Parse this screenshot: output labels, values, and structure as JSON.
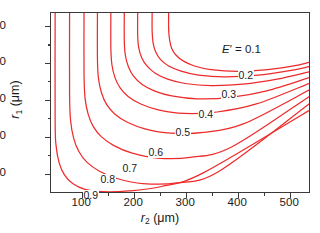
{
  "figure": {
    "background": "#ffffff",
    "frame_color": "#3a3a3a",
    "contour_color": "#ee2b2b"
  },
  "axes": {
    "x_title_var": "r",
    "x_title_sub": "2",
    "x_title_unit": " (μm)",
    "y_title_var": "r",
    "y_title_sub": "1",
    "y_title_unit": " (μm)",
    "x_ticks": [
      "100",
      "200",
      "300",
      "400",
      "500"
    ],
    "y_ticks": [
      "500",
      "400",
      "300",
      "200",
      "100"
    ]
  },
  "series_label": {
    "prefix_var": "E",
    "prefix_prime": "′",
    "prefix_eq": " = ",
    "first_value": "0.1"
  },
  "contour_labels": [
    "0.1",
    "0.2",
    "0.3",
    "0.4",
    "0.5",
    "0.6",
    "0.7",
    "0.8",
    "0.9"
  ],
  "chart_data": {
    "type": "line",
    "title": "",
    "subtitle": "",
    "xlabel": "r2 (μm)",
    "ylabel": "r1 (μm)",
    "xlim": [
      40,
      540
    ],
    "ylim": [
      55,
      545
    ],
    "grid": false,
    "legend": "inline contour labels",
    "annotations": [
      "E' = 0.1"
    ],
    "x_tick_values": [
      100,
      200,
      300,
      400,
      500
    ],
    "y_tick_values": [
      100,
      200,
      300,
      400,
      500
    ],
    "x_minor_tick_values": [
      150,
      250,
      350,
      450
    ],
    "y_minor_tick_values": [
      150,
      250,
      350,
      450
    ],
    "series": [
      {
        "name": "0.1",
        "label": "0.1",
        "label_at": [
          305,
          470
        ],
        "points": [
          [
            268,
            545
          ],
          [
            268,
            500
          ],
          [
            270,
            470
          ],
          [
            274,
            448
          ],
          [
            282,
            430
          ],
          [
            296,
            414
          ],
          [
            318,
            400
          ],
          [
            350,
            390
          ],
          [
            400,
            385
          ],
          [
            460,
            390
          ],
          [
            510,
            400
          ],
          [
            540,
            410
          ]
        ]
      },
      {
        "name": "0.2",
        "label": "0.2",
        "label_at": [
          300,
          415
        ],
        "points": [
          [
            236,
            545
          ],
          [
            236,
            495
          ],
          [
            238,
            462
          ],
          [
            243,
            438
          ],
          [
            252,
            418
          ],
          [
            268,
            400
          ],
          [
            292,
            386
          ],
          [
            326,
            375
          ],
          [
            376,
            370
          ],
          [
            436,
            374
          ],
          [
            496,
            386
          ],
          [
            540,
            398
          ]
        ]
      },
      {
        "name": "0.3",
        "label": "0.3",
        "label_at": [
          280,
          368
        ],
        "points": [
          [
            208,
            545
          ],
          [
            208,
            485
          ],
          [
            210,
            450
          ],
          [
            216,
            422
          ],
          [
            226,
            400
          ],
          [
            242,
            380
          ],
          [
            266,
            364
          ],
          [
            300,
            352
          ],
          [
            350,
            346
          ],
          [
            412,
            350
          ],
          [
            478,
            364
          ],
          [
            540,
            384
          ]
        ]
      },
      {
        "name": "0.4",
        "label": "0.4",
        "label_at": [
          252,
          312
        ],
        "points": [
          [
            182,
            545
          ],
          [
            182,
            470
          ],
          [
            184,
            430
          ],
          [
            190,
            398
          ],
          [
            200,
            372
          ],
          [
            216,
            350
          ],
          [
            240,
            332
          ],
          [
            274,
            318
          ],
          [
            324,
            310
          ],
          [
            388,
            314
          ],
          [
            458,
            332
          ],
          [
            540,
            368
          ]
        ]
      },
      {
        "name": "0.5",
        "label": "0.5",
        "label_at": [
          222,
          264
        ],
        "points": [
          [
            156,
            545
          ],
          [
            156,
            450
          ],
          [
            158,
            404
          ],
          [
            164,
            368
          ],
          [
            174,
            340
          ],
          [
            190,
            316
          ],
          [
            214,
            296
          ],
          [
            248,
            280
          ],
          [
            298,
            270
          ],
          [
            362,
            274
          ],
          [
            438,
            296
          ],
          [
            540,
            352
          ]
        ]
      },
      {
        "name": "0.6",
        "label": "0.6",
        "label_at": [
          186,
          214
        ],
        "points": [
          [
            130,
            545
          ],
          [
            130,
            420
          ],
          [
            132,
            366
          ],
          [
            138,
            326
          ],
          [
            148,
            294
          ],
          [
            164,
            268
          ],
          [
            188,
            246
          ],
          [
            222,
            228
          ],
          [
            272,
            216
          ],
          [
            336,
            218
          ],
          [
            414,
            242
          ],
          [
            540,
            334
          ]
        ]
      },
      {
        "name": "0.7",
        "label": "0.7",
        "label_at": [
          150,
          172
        ],
        "points": [
          [
            104,
            545
          ],
          [
            104,
            378
          ],
          [
            106,
            312
          ],
          [
            112,
            268
          ],
          [
            122,
            234
          ],
          [
            138,
            206
          ],
          [
            162,
            182
          ],
          [
            196,
            162
          ],
          [
            246,
            148
          ],
          [
            310,
            150
          ],
          [
            390,
            178
          ],
          [
            540,
            316
          ]
        ]
      },
      {
        "name": "0.8",
        "label": "0.8",
        "label_at": [
          118,
          140
        ],
        "points": [
          [
            76,
            545
          ],
          [
            76,
            322
          ],
          [
            78,
            250
          ],
          [
            84,
            202
          ],
          [
            94,
            166
          ],
          [
            110,
            136
          ],
          [
            134,
            112
          ],
          [
            168,
            92
          ],
          [
            218,
            78
          ],
          [
            284,
            80
          ],
          [
            366,
            112
          ],
          [
            540,
            296
          ]
        ]
      },
      {
        "name": "0.9",
        "label": "0.9",
        "label_at": [
          84,
          96
        ],
        "points": [
          [
            48,
            545
          ],
          [
            48,
            250
          ],
          [
            50,
            180
          ],
          [
            56,
            134
          ],
          [
            66,
            102
          ],
          [
            82,
            78
          ],
          [
            106,
            62
          ],
          [
            140,
            56
          ],
          [
            190,
            58
          ],
          [
            254,
            70
          ],
          [
            336,
            108
          ],
          [
            540,
            278
          ]
        ]
      }
    ]
  }
}
